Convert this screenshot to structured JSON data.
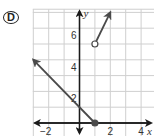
{
  "option_label": "D",
  "chart_data": {
    "type": "line",
    "title": "",
    "xlabel": "x",
    "ylabel": "y",
    "xlim": [
      -3,
      4.9
    ],
    "ylim": [
      -0.8,
      7.2
    ],
    "grid": true,
    "x_tick_labels": [
      "-2",
      "2",
      "4"
    ],
    "y_tick_labels": [
      "2",
      "4",
      "6"
    ],
    "pieces": [
      {
        "name": "left ray",
        "equation": "y = -x + 1",
        "domain": "x <= 1",
        "points": [
          [
            -3,
            4
          ],
          [
            0,
            1
          ],
          [
            1,
            0
          ]
        ],
        "endpoint": {
          "x": 1,
          "y": 0,
          "style": "closed"
        },
        "arrow_toward": [
          -3,
          4
        ]
      },
      {
        "name": "right ray",
        "equation": "y = 2x + 3",
        "domain": "x > 1",
        "points": [
          [
            1,
            5
          ],
          [
            2,
            7
          ]
        ],
        "endpoint": {
          "x": 1,
          "y": 5,
          "style": "open"
        },
        "arrow_toward": [
          2,
          7
        ]
      }
    ]
  },
  "colors": {
    "grid": "#cfcfcf",
    "axis": "#1a1a1a",
    "curve": "#4a4a4a"
  }
}
